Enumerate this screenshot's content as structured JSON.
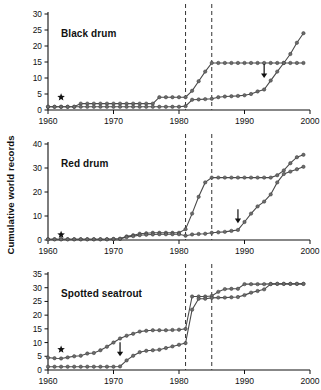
{
  "figure": {
    "ylabel": "Cumulative world records",
    "xlabel": "",
    "x_ticks": [
      "1960",
      "1970",
      "1980",
      "1990",
      "2000"
    ],
    "xlim": [
      1960,
      2000
    ],
    "marker_star_label": "star",
    "marker_arrow_label": "arrow"
  },
  "chart_data": {
    "type": "line",
    "xlabel": "",
    "ylabel": "Cumulative world records",
    "xlim": [
      1960,
      2000
    ],
    "grid": false,
    "legend": "none",
    "panels": [
      {
        "name": "black-drum",
        "title": "Black drum",
        "ylim": [
          0,
          30
        ],
        "yticks": [
          0,
          5,
          10,
          15,
          20,
          25,
          30
        ],
        "dashed_lines": [
          1981,
          1985
        ],
        "star": {
          "x": 1962,
          "y": 4
        },
        "arrow": {
          "x": 1993,
          "y": 10
        },
        "series": [
          {
            "name": "upper",
            "x": [
              1960,
              1961,
              1962,
              1963,
              1964,
              1965,
              1966,
              1967,
              1968,
              1969,
              1970,
              1971,
              1972,
              1973,
              1974,
              1975,
              1976,
              1977,
              1978,
              1979,
              1980,
              1981,
              1982,
              1983,
              1984,
              1985,
              1986,
              1987,
              1988,
              1989,
              1990,
              1991,
              1992,
              1993,
              1994,
              1995,
              1996,
              1997,
              1998,
              1999
            ],
            "y": [
              1,
              1,
              1,
              1,
              1,
              2,
              2,
              2,
              2,
              2,
              2,
              2,
              2,
              2,
              2,
              2,
              2,
              4,
              4,
              4,
              4,
              4,
              6,
              9,
              12,
              14.7,
              14.7,
              14.7,
              14.7,
              14.7,
              14.7,
              14.7,
              14.7,
              14.7,
              14.7,
              14.7,
              14.7,
              14.7,
              14.7,
              14.7
            ]
          },
          {
            "name": "lower",
            "x": [
              1960,
              1961,
              1962,
              1963,
              1964,
              1965,
              1966,
              1967,
              1968,
              1969,
              1970,
              1971,
              1972,
              1973,
              1974,
              1975,
              1976,
              1977,
              1978,
              1979,
              1980,
              1981,
              1982,
              1983,
              1984,
              1985,
              1986,
              1987,
              1988,
              1989,
              1990,
              1991,
              1992,
              1993,
              1994,
              1995,
              1996,
              1997,
              1998,
              1999
            ],
            "y": [
              1,
              1,
              1,
              1,
              1,
              1,
              1,
              1,
              1,
              1,
              1,
              1,
              1,
              1,
              1,
              1,
              1,
              1,
              1,
              1,
              1,
              1.2,
              3.2,
              3.3,
              3.4,
              3.5,
              4,
              4.2,
              4.3,
              4.4,
              4.6,
              5,
              5.8,
              6.4,
              9.2,
              12,
              14.7,
              17.5,
              21,
              24
            ]
          }
        ]
      },
      {
        "name": "red-drum",
        "title": "Red drum",
        "ylim": [
          0,
          40
        ],
        "yticks": [
          0,
          10,
          20,
          30,
          40
        ],
        "dashed_lines": [
          1981,
          1985
        ],
        "star": {
          "x": 1962,
          "y": 2.2
        },
        "arrow": {
          "x": 1989,
          "y": 7
        },
        "series": [
          {
            "name": "upper",
            "x": [
              1960,
              1961,
              1962,
              1963,
              1964,
              1965,
              1966,
              1967,
              1968,
              1969,
              1970,
              1971,
              1972,
              1973,
              1974,
              1975,
              1976,
              1977,
              1978,
              1979,
              1980,
              1981,
              1982,
              1983,
              1984,
              1985,
              1986,
              1987,
              1988,
              1989,
              1990,
              1991,
              1992,
              1993,
              1994,
              1995,
              1996,
              1997,
              1998,
              1999
            ],
            "y": [
              0.3,
              0.3,
              0.3,
              0.3,
              0.3,
              0.3,
              0.3,
              0.3,
              0.3,
              0.3,
              0.4,
              0.5,
              1.5,
              2,
              2.6,
              2.8,
              3,
              3,
              3,
              3,
              3,
              4.5,
              11,
              18,
              24,
              26,
              26,
              26,
              26,
              26,
              26,
              26,
              26,
              26,
              26,
              27,
              29,
              32,
              34.5,
              35.5
            ]
          },
          {
            "name": "lower",
            "x": [
              1960,
              1961,
              1962,
              1963,
              1964,
              1965,
              1966,
              1967,
              1968,
              1969,
              1970,
              1971,
              1972,
              1973,
              1974,
              1975,
              1976,
              1977,
              1978,
              1979,
              1980,
              1981,
              1982,
              1983,
              1984,
              1985,
              1986,
              1987,
              1988,
              1989,
              1990,
              1991,
              1992,
              1993,
              1994,
              1995,
              1996,
              1997,
              1998,
              1999
            ],
            "y": [
              0.3,
              0.3,
              0.3,
              0.3,
              0.3,
              0.3,
              0.3,
              0.3,
              0.3,
              0.3,
              0.4,
              0.5,
              1.2,
              1.6,
              2,
              2.2,
              2.3,
              2.4,
              2.4,
              2.4,
              2.4,
              1.8,
              2.3,
              2.5,
              2.6,
              3,
              3.2,
              3.4,
              3.8,
              4.2,
              7.5,
              11,
              14,
              16,
              19,
              24,
              27.5,
              28.5,
              29.5,
              30.5
            ]
          }
        ]
      },
      {
        "name": "spotted-seatrout",
        "title": "Spotted seatrout",
        "ylim": [
          0,
          35
        ],
        "yticks": [
          0,
          5,
          10,
          15,
          20,
          25,
          30,
          35
        ],
        "dashed_lines": [
          1981,
          1985
        ],
        "star": {
          "x": 1962,
          "y": 7.5
        },
        "arrow": {
          "x": 1971,
          "y": 5
        },
        "series": [
          {
            "name": "upper",
            "x": [
              1960,
              1961,
              1962,
              1963,
              1964,
              1965,
              1966,
              1967,
              1968,
              1969,
              1970,
              1971,
              1972,
              1973,
              1974,
              1975,
              1976,
              1977,
              1978,
              1979,
              1980,
              1981,
              1982,
              1983,
              1984,
              1985,
              1986,
              1987,
              1988,
              1989,
              1990,
              1991,
              1992,
              1993,
              1994,
              1995,
              1996,
              1997,
              1998,
              1999
            ],
            "y": [
              4.5,
              4.3,
              4.2,
              4.6,
              5,
              5.2,
              6,
              6.2,
              7.2,
              8.5,
              10,
              11.5,
              12.5,
              13.2,
              14,
              14.3,
              14.5,
              14.5,
              14.5,
              14.6,
              14.7,
              15,
              26.8,
              26.8,
              26.8,
              27,
              28.5,
              29.5,
              29.6,
              29.6,
              31.3,
              31.3,
              31.3,
              31.3,
              31.4,
              31.4,
              31.4,
              31.4,
              31.4,
              31.4
            ]
          },
          {
            "name": "lower",
            "x": [
              1960,
              1961,
              1962,
              1963,
              1964,
              1965,
              1966,
              1967,
              1968,
              1969,
              1970,
              1971,
              1972,
              1973,
              1974,
              1975,
              1976,
              1977,
              1978,
              1979,
              1980,
              1981,
              1982,
              1983,
              1984,
              1985,
              1986,
              1987,
              1988,
              1989,
              1990,
              1991,
              1992,
              1993,
              1994,
              1995,
              1996,
              1997,
              1998,
              1999
            ],
            "y": [
              1.2,
              1.2,
              1.2,
              1.2,
              1.2,
              1.2,
              1.2,
              1.2,
              1.2,
              1.2,
              1.2,
              1.3,
              3.5,
              5.2,
              6.5,
              7,
              7.2,
              7.4,
              8,
              8.6,
              9.2,
              9.8,
              22,
              26,
              26,
              26.3,
              26.4,
              26.4,
              26.5,
              26.6,
              27.3,
              28.2,
              28.8,
              29.4,
              31.3,
              31.4,
              31.4,
              31.4,
              31.4,
              31.4
            ]
          }
        ]
      }
    ]
  }
}
